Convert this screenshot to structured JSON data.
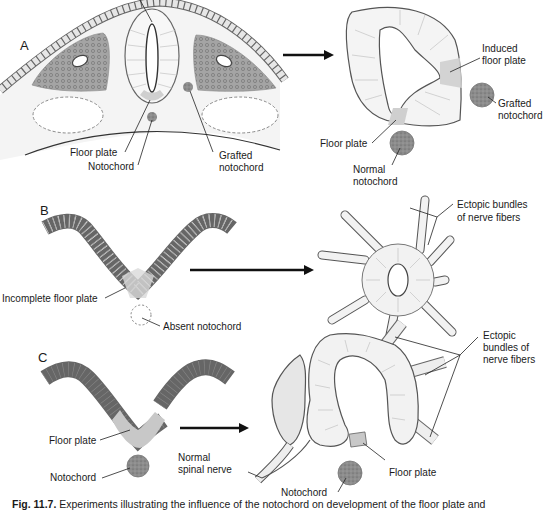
{
  "figure": {
    "number": "Fig. 11.7.",
    "caption": "Experiments illustrating the influence of the notochord on development of the floor plate and",
    "colors": {
      "outline": "#555555",
      "tissue_fill": "#f2f2f2",
      "floor_plate_fill": "#cfcfcf",
      "somite_fill": "#9a9a9a",
      "notochord_fill": "#8a8a8a",
      "arrow": "#111111"
    }
  },
  "panels": {
    "A": {
      "label": "A",
      "left_labels": {
        "floor_plate": "Floor plate",
        "notochord": "Notochord",
        "grafted_notochord_line1": "Grafted",
        "grafted_notochord_line2": "notochord"
      },
      "right_labels": {
        "induced_floor_plate_line1": "Induced",
        "induced_floor_plate_line2": "floor plate",
        "grafted_notochord_line1": "Grafted",
        "grafted_notochord_line2": "notochord",
        "floor_plate": "Floor plate",
        "normal_notochord_line1": "Normal",
        "normal_notochord_line2": "notochord"
      }
    },
    "B": {
      "label": "B",
      "left_labels": {
        "incomplete_floor_plate": "Incomplete floor plate",
        "absent_notochord": "Absent notochord"
      },
      "right_labels": {
        "ectopic_line1": "Ectopic bundles",
        "ectopic_line2": "of nerve fibers"
      }
    },
    "C": {
      "label": "C",
      "left_labels": {
        "floor_plate": "Floor plate",
        "notochord": "Notochord"
      },
      "right_labels": {
        "normal_spinal_nerve_line1": "Normal",
        "normal_spinal_nerve_line2": "spinal nerve",
        "floor_plate": "Floor plate",
        "notochord": "Notochord",
        "ectopic_line1": "Ectopic",
        "ectopic_line2": "bundles of",
        "ectopic_line3": "nerve fibers"
      }
    }
  }
}
